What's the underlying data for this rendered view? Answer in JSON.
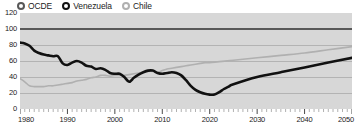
{
  "chart_data": {
    "type": "line",
    "title": "",
    "subtitle": "",
    "xlabel": "",
    "ylabel": "",
    "xlim": [
      1980,
      2050
    ],
    "ylim": [
      0,
      120
    ],
    "grid": true,
    "legend_position": "top-left",
    "y_ticks": [
      0,
      20,
      40,
      60,
      80,
      100,
      120
    ],
    "x_ticks": [
      1980,
      1990,
      2000,
      2010,
      2020,
      2030,
      2040,
      2050
    ],
    "x_tick_labels": [
      "1980",
      "1990",
      "2000",
      "2010",
      "2020",
      "2030",
      "2040",
      "2050"
    ],
    "y_tick_labels": [
      "0",
      "20",
      "40",
      "60",
      "80",
      "100",
      "120"
    ],
    "colors": {
      "ocde": "#585858",
      "venezuela": "#111111",
      "chile": "#b0b0b0",
      "plot_background": "#d7d7d7",
      "gridline": "#a9a9a9",
      "text": "#1b1b1b"
    },
    "series": [
      {
        "name": "OCDE",
        "color": "#585858",
        "x": [
          1980,
          2050
        ],
        "values": [
          100,
          100
        ]
      },
      {
        "name": "Venezuela",
        "color": "#111111",
        "x": [
          1980,
          1981,
          1982,
          1983,
          1984,
          1985,
          1986,
          1987,
          1988,
          1989,
          1990,
          1991,
          1992,
          1993,
          1994,
          1995,
          1996,
          1997,
          1998,
          1999,
          2000,
          2001,
          2002,
          2003,
          2004,
          2005,
          2006,
          2007,
          2008,
          2009,
          2010,
          2011,
          2012,
          2013,
          2014,
          2015,
          2016,
          2017,
          2018,
          2019,
          2020,
          2021,
          2022,
          2023,
          2024,
          2025,
          2030,
          2035,
          2040,
          2045,
          2050
        ],
        "values": [
          83,
          82,
          79,
          73,
          70,
          68,
          67,
          66,
          66,
          57,
          55,
          58,
          60,
          58,
          54,
          53,
          50,
          51,
          49,
          45,
          44,
          44,
          40,
          34,
          39,
          43,
          46,
          48,
          48,
          45,
          44,
          45,
          46,
          45,
          42,
          36,
          29,
          24,
          21,
          19,
          18,
          18,
          21,
          25,
          28,
          31,
          40,
          46,
          52,
          58,
          64
        ]
      },
      {
        "name": "Chile",
        "color": "#b0b0b0",
        "x": [
          1980,
          1981,
          1982,
          1983,
          1984,
          1985,
          1986,
          1987,
          1988,
          1989,
          1990,
          1991,
          1992,
          1993,
          1994,
          1995,
          1996,
          1997,
          1998,
          1999,
          2000,
          2001,
          2002,
          2003,
          2004,
          2005,
          2006,
          2007,
          2008,
          2009,
          2010,
          2011,
          2012,
          2013,
          2014,
          2015,
          2016,
          2017,
          2018,
          2019,
          2020,
          2025,
          2030,
          2035,
          2040,
          2045,
          2050
        ],
        "values": [
          38,
          34,
          29,
          28,
          28,
          28,
          29,
          29,
          30,
          31,
          32,
          33,
          35,
          36,
          37,
          39,
          40,
          42,
          42,
          41,
          42,
          42,
          42,
          43,
          44,
          45,
          46,
          47,
          47,
          46,
          48,
          50,
          51,
          52,
          53,
          54,
          55,
          56,
          57,
          58,
          58,
          61,
          64,
          67,
          70,
          74,
          78
        ]
      }
    ]
  },
  "legend": {
    "items": [
      {
        "label": "OCDE",
        "marker_color": "#585858"
      },
      {
        "label": "Venezuela",
        "marker_color": "#111111"
      },
      {
        "label": "Chile",
        "marker_color": "#b0b0b0"
      }
    ]
  }
}
